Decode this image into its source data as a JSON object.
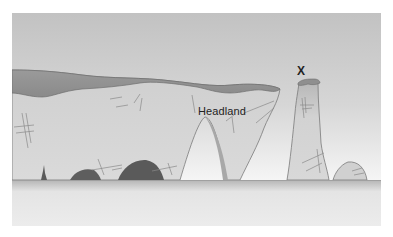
{
  "diagram": {
    "type": "coastal-erosion-landforms",
    "labels": {
      "headland": "Headland",
      "stack_marker": "X"
    },
    "colors": {
      "sky_top": "#c4c4c4",
      "sky_bottom": "#f2f2f2",
      "cliff_face": "#d4d4d4",
      "cliff_cap": "#8f8f8f",
      "cave": "#5c5c5c",
      "sea_line": "#a6a6a6",
      "sea": "#e6e6e6",
      "crack": "#8a8a8a"
    },
    "features": [
      "headland",
      "cave",
      "arch",
      "stack",
      "stump"
    ]
  }
}
